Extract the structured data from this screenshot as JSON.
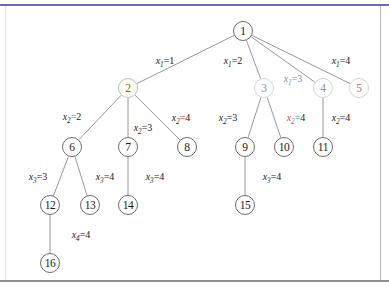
{
  "figure": {
    "type": "tree-diagram"
  },
  "nodes": [
    {
      "id": "n1",
      "label": "1",
      "x": 243,
      "y": 31,
      "style": "plain"
    },
    {
      "id": "n2",
      "label": "2",
      "x": 128,
      "y": 88,
      "style": "highlight"
    },
    {
      "id": "n3",
      "label": "3",
      "x": 264,
      "y": 88,
      "style": "faint"
    },
    {
      "id": "n4",
      "label": "4",
      "x": 323,
      "y": 88,
      "style": "faint"
    },
    {
      "id": "n5",
      "label": "5",
      "x": 359,
      "y": 88,
      "style": "faint-warm"
    },
    {
      "id": "n6",
      "label": "6",
      "x": 72,
      "y": 147,
      "style": "plain"
    },
    {
      "id": "n7",
      "label": "7",
      "x": 128,
      "y": 147,
      "style": "plain"
    },
    {
      "id": "n8",
      "label": "8",
      "x": 187,
      "y": 147,
      "style": "plain"
    },
    {
      "id": "n9",
      "label": "9",
      "x": 245,
      "y": 147,
      "style": "plain"
    },
    {
      "id": "n10",
      "label": "10",
      "x": 284,
      "y": 147,
      "style": "plain"
    },
    {
      "id": "n11",
      "label": "11",
      "x": 323,
      "y": 147,
      "style": "plain"
    },
    {
      "id": "n12",
      "label": "12",
      "x": 50,
      "y": 205,
      "style": "plain"
    },
    {
      "id": "n13",
      "label": "13",
      "x": 90,
      "y": 205,
      "style": "plain"
    },
    {
      "id": "n14",
      "label": "14",
      "x": 128,
      "y": 205,
      "style": "plain"
    },
    {
      "id": "n15",
      "label": "15",
      "x": 245,
      "y": 205,
      "style": "plain"
    },
    {
      "id": "n16",
      "label": "16",
      "x": 50,
      "y": 263,
      "style": "plain"
    }
  ],
  "edges": [
    {
      "id": "e1",
      "from": "n1",
      "to": "n2"
    },
    {
      "id": "e2",
      "from": "n1",
      "to": "n3"
    },
    {
      "id": "e3",
      "from": "n1",
      "to": "n4"
    },
    {
      "id": "e4",
      "from": "n1",
      "to": "n5"
    },
    {
      "id": "e5",
      "from": "n2",
      "to": "n6"
    },
    {
      "id": "e6",
      "from": "n2",
      "to": "n7"
    },
    {
      "id": "e7",
      "from": "n2",
      "to": "n8"
    },
    {
      "id": "e8",
      "from": "n3",
      "to": "n9"
    },
    {
      "id": "e9",
      "from": "n3",
      "to": "n10"
    },
    {
      "id": "e10",
      "from": "n4",
      "to": "n11"
    },
    {
      "id": "e11",
      "from": "n6",
      "to": "n12"
    },
    {
      "id": "e12",
      "from": "n6",
      "to": "n13"
    },
    {
      "id": "e13",
      "from": "n7",
      "to": "n14"
    },
    {
      "id": "e14",
      "from": "n9",
      "to": "n15"
    },
    {
      "id": "e15",
      "from": "n12",
      "to": "n16"
    }
  ],
  "edge_labels": [
    {
      "id": "l1",
      "var": "x",
      "sub": "1",
      "eq": "=",
      "value": "1",
      "x": 165,
      "y": 62,
      "color": "plain"
    },
    {
      "id": "l2",
      "var": "x",
      "sub": "1",
      "eq": "=",
      "value": "2",
      "x": 233,
      "y": 62,
      "color": "plain"
    },
    {
      "id": "l3",
      "var": "x",
      "sub": "1",
      "eq": "=",
      "value": "3",
      "x": 293,
      "y": 80,
      "color": "faint"
    },
    {
      "id": "l4",
      "var": "x",
      "sub": "1",
      "eq": "=",
      "value": "4",
      "x": 341,
      "y": 62,
      "color": "plain"
    },
    {
      "id": "l5",
      "var": "x",
      "sub": "2",
      "eq": "=",
      "value": "2",
      "x": 72,
      "y": 118,
      "color": "teal"
    },
    {
      "id": "l6",
      "var": "x",
      "sub": "2",
      "eq": "=",
      "value": "3",
      "x": 143,
      "y": 129,
      "color": "plain"
    },
    {
      "id": "l7",
      "var": "x",
      "sub": "2",
      "eq": "=",
      "value": "4",
      "x": 181,
      "y": 119,
      "color": "redeq"
    },
    {
      "id": "l8",
      "var": "x",
      "sub": "2",
      "eq": "=",
      "value": "3",
      "x": 228,
      "y": 119,
      "color": "plain"
    },
    {
      "id": "l9",
      "var": "x",
      "sub": "2",
      "eq": "=",
      "value": "4",
      "x": 296,
      "y": 119,
      "color": "tealred"
    },
    {
      "id": "l10",
      "var": "x",
      "sub": "2",
      "eq": "=",
      "value": "4",
      "x": 341,
      "y": 119,
      "color": "plain"
    },
    {
      "id": "l11",
      "var": "x",
      "sub": "3",
      "eq": "=",
      "value": "3",
      "x": 38,
      "y": 178,
      "color": "plain"
    },
    {
      "id": "l12",
      "var": "x",
      "sub": "3",
      "eq": "=",
      "value": "4",
      "x": 105,
      "y": 178,
      "color": "plain"
    },
    {
      "id": "l13",
      "var": "x",
      "sub": "3",
      "eq": "=",
      "value": "4",
      "x": 155,
      "y": 178,
      "color": "plain"
    },
    {
      "id": "l14",
      "var": "x",
      "sub": "3",
      "eq": "=",
      "value": "4",
      "x": 272,
      "y": 178,
      "color": "plain"
    },
    {
      "id": "l15",
      "var": "x",
      "sub": "4",
      "eq": "=",
      "value": "4",
      "x": 81,
      "y": 236,
      "color": "plain"
    }
  ],
  "colors": {
    "node_stroke": "#6d6d6d",
    "edge_stroke": "#8c8c8c",
    "text": "#1a1a1a",
    "accent_teal": "#1a9e8f",
    "accent_red": "#d02020",
    "highlight_green": "#5d7a1f",
    "rule_top": "#6a6ab4",
    "rule_bottom": "#8f8f8f"
  }
}
